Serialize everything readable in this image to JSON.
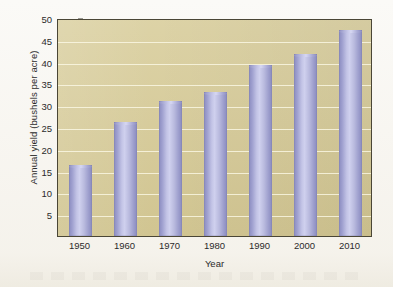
{
  "chart_data": {
    "type": "bar",
    "title": "",
    "subtitle": "",
    "xlabel": "Year",
    "ylabel": "Annual yield (bushels per acre)",
    "categories": [
      "1950",
      "1960",
      "1970",
      "1980",
      "1990",
      "2000",
      "2010"
    ],
    "values": [
      16.3,
      26.2,
      31.0,
      33.0,
      39.2,
      41.7,
      47.3
    ],
    "ylim": [
      0,
      50
    ],
    "yticks": [
      5,
      10,
      15,
      20,
      25,
      30,
      35,
      40,
      45,
      50
    ],
    "ytick_labels": [
      "5",
      "10",
      "15",
      "20",
      "25",
      "30",
      "35",
      "40",
      "45",
      "50"
    ],
    "xtick_labels": [
      "1950",
      "1960",
      "1970",
      "1980",
      "1990",
      "2000",
      "2010"
    ],
    "gridlines": true,
    "grid_axis": "y",
    "legend": null,
    "legend_position": "none",
    "annotations": [],
    "series": [
      {
        "name": "Annual yield",
        "values": [
          16.3,
          26.2,
          31.0,
          33.0,
          39.2,
          41.7,
          47.3
        ]
      }
    ]
  },
  "style": {
    "plot_background": "#d3c793",
    "bar_color": "#b3b4dd",
    "bar_edge_color": "#8b8cc0",
    "gridline_color": "#fcfae8",
    "axis_color": "#4a4636",
    "text_color": "#2b2b2b",
    "page_background": "#fbfaf7"
  }
}
